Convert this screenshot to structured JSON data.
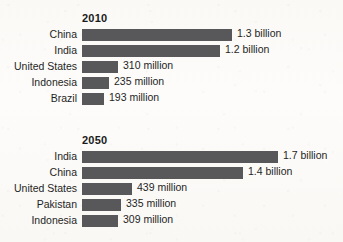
{
  "chart_data": {
    "type": "bar",
    "title": "",
    "xlabel": "",
    "ylabel": "",
    "orientation": "horizontal",
    "grid": false,
    "legend": "none",
    "value_unit": "people",
    "xlim": [
      0,
      1.8
    ],
    "groups": [
      {
        "label": "2010",
        "categories": [
          "China",
          "India",
          "United States",
          "Indonesia",
          "Brazil"
        ],
        "values": [
          1300000000,
          1200000000,
          310000000,
          235000000,
          193000000
        ],
        "value_labels": [
          "1.3 billion",
          "1.2 billion",
          "310 million",
          "235 million",
          "193 million"
        ],
        "values_in_billions": [
          1.3,
          1.2,
          0.31,
          0.235,
          0.193
        ]
      },
      {
        "label": "2050",
        "categories": [
          "India",
          "China",
          "United States",
          "Pakistan",
          "Indonesia"
        ],
        "values": [
          1700000000,
          1400000000,
          439000000,
          335000000,
          309000000
        ],
        "value_labels": [
          "1.7 billion",
          "1.4 billion",
          "439 million",
          "335 million",
          "309 million"
        ],
        "values_in_billions": [
          1.7,
          1.4,
          0.439,
          0.335,
          0.309
        ]
      }
    ],
    "colors": {
      "bar": "#58585a",
      "text": "#1f1f1f",
      "background": "#fbfaf8"
    }
  }
}
